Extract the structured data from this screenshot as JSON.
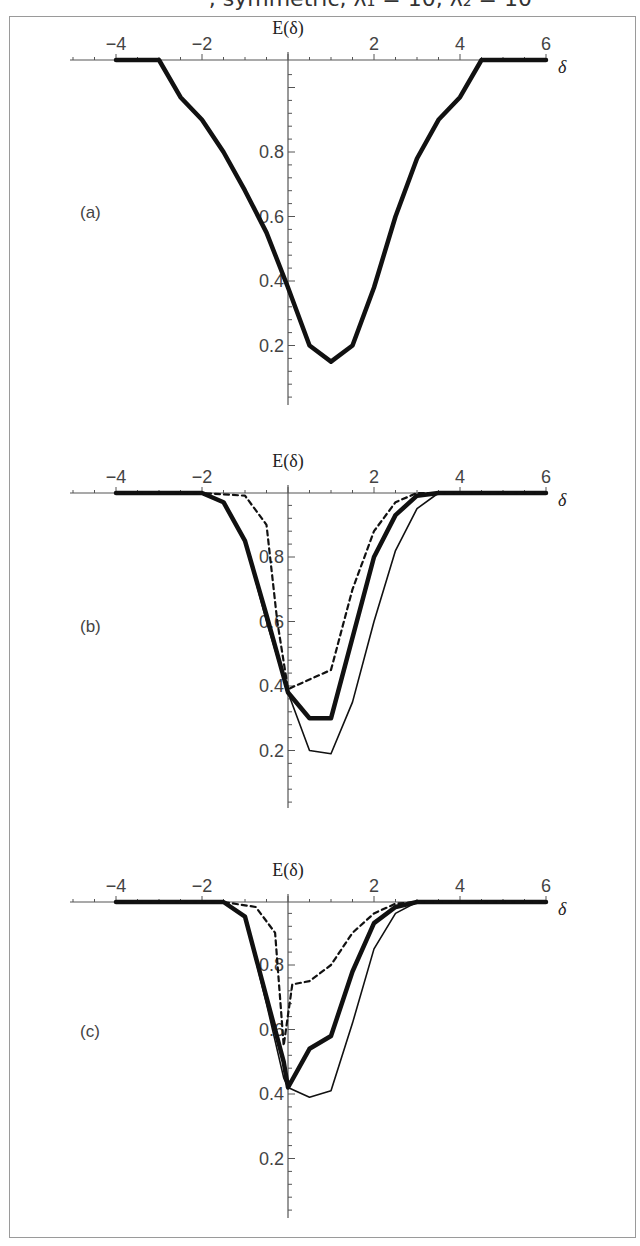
{
  "header": {
    "partial_title": ", symmetric, λ₁ = 10, λ₂ = 10"
  },
  "chart_data": [
    {
      "type": "line",
      "panel": "(a)",
      "ylabel": "E(δ)",
      "xlabel": "δ",
      "xticks": [
        "-4",
        "-2",
        "2",
        "4",
        "6"
      ],
      "yticks": [
        "0.8",
        "0.6",
        "0.4",
        "0.2"
      ],
      "xlim": [
        -5,
        6
      ],
      "series": [
        {
          "name": "solid",
          "style": "thick",
          "x": [
            -4,
            -3,
            -2.5,
            -2,
            -1.5,
            -1,
            -0.5,
            0,
            0.5,
            1,
            1.5,
            2,
            2.5,
            3,
            3.5,
            4,
            4.5,
            6
          ],
          "y": [
            1,
            1,
            0.97,
            0.9,
            0.8,
            0.68,
            0.55,
            0.38,
            0.2,
            0.15,
            0.2,
            0.38,
            0.6,
            0.78,
            0.9,
            0.97,
            1,
            1
          ]
        }
      ]
    },
    {
      "type": "line",
      "panel": "(b)",
      "ylabel": "E(δ)",
      "xlabel": "δ",
      "xticks": [
        "-4",
        "-2",
        "2",
        "4",
        "6"
      ],
      "yticks": [
        "0.8",
        "0.6",
        "0.4",
        "0.2"
      ],
      "xlim": [
        -5,
        6
      ],
      "series": [
        {
          "name": "thick",
          "style": "thick",
          "x": [
            -4,
            -2,
            -1.5,
            -1,
            -0.5,
            0,
            0.5,
            1,
            1.5,
            2,
            2.5,
            3,
            3.5,
            6
          ],
          "y": [
            1,
            1,
            0.97,
            0.85,
            0.62,
            0.38,
            0.3,
            0.3,
            0.55,
            0.8,
            0.93,
            0.99,
            1,
            1
          ]
        },
        {
          "name": "thin",
          "style": "thin",
          "x": [
            -4,
            -2,
            -1.5,
            -1,
            -0.5,
            0,
            0.5,
            1,
            1.5,
            2,
            2.5,
            3,
            3.5,
            6
          ],
          "y": [
            1,
            1,
            0.97,
            0.85,
            0.6,
            0.38,
            0.2,
            0.19,
            0.35,
            0.6,
            0.82,
            0.95,
            1,
            1
          ]
        },
        {
          "name": "dashed",
          "style": "dashed",
          "x": [
            -4,
            -2,
            -1,
            -0.5,
            -0.25,
            0,
            0.5,
            1,
            1.5,
            2,
            2.5,
            3,
            6
          ],
          "y": [
            1,
            1,
            0.99,
            0.9,
            0.6,
            0.39,
            0.42,
            0.45,
            0.7,
            0.88,
            0.97,
            1,
            1
          ]
        }
      ]
    },
    {
      "type": "line",
      "panel": "(c)",
      "ylabel": "E(δ)",
      "xlabel": "δ",
      "xticks": [
        "-4",
        "-2",
        "2",
        "4",
        "6"
      ],
      "yticks": [
        "0.8",
        "0.6",
        "0.4",
        "0.2"
      ],
      "xlim": [
        -5,
        6
      ],
      "series": [
        {
          "name": "thick",
          "style": "thick",
          "x": [
            -4,
            -1.5,
            -1,
            -0.5,
            -0.1,
            0,
            0.5,
            1,
            1.5,
            2,
            2.5,
            3,
            6
          ],
          "y": [
            1,
            1,
            0.95,
            0.7,
            0.5,
            0.42,
            0.54,
            0.58,
            0.78,
            0.93,
            0.98,
            1,
            1
          ]
        },
        {
          "name": "thin",
          "style": "thin",
          "x": [
            -4,
            -1.5,
            -1,
            -0.5,
            -0.1,
            0,
            0.5,
            1,
            1.5,
            2,
            2.5,
            3,
            6
          ],
          "y": [
            1,
            1,
            0.95,
            0.68,
            0.45,
            0.42,
            0.39,
            0.41,
            0.62,
            0.85,
            0.96,
            1,
            1
          ]
        },
        {
          "name": "dashed",
          "style": "dashed",
          "x": [
            -4,
            -1.5,
            -0.75,
            -0.3,
            -0.1,
            0.1,
            0.5,
            1,
            1.5,
            2,
            2.5,
            3,
            6
          ],
          "y": [
            1,
            1,
            0.98,
            0.9,
            0.55,
            0.74,
            0.75,
            0.8,
            0.9,
            0.96,
            0.99,
            1,
            1
          ]
        }
      ]
    }
  ]
}
